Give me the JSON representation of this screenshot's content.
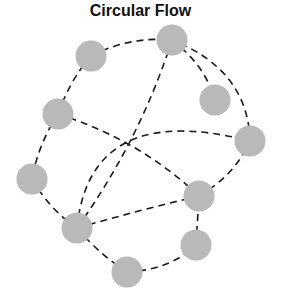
{
  "title": "Circular Flow",
  "colors": {
    "node": "#b9b9b9",
    "edge": "#1a1a1a",
    "background": "#ffffff"
  },
  "nodes": [
    {
      "id": "n1",
      "x": 91,
      "y": 56
    },
    {
      "id": "n2",
      "x": 172,
      "y": 40
    },
    {
      "id": "n3",
      "x": 215,
      "y": 100
    },
    {
      "id": "n4",
      "x": 58,
      "y": 114
    },
    {
      "id": "n5",
      "x": 250,
      "y": 141
    },
    {
      "id": "n6",
      "x": 32,
      "y": 179
    },
    {
      "id": "n7",
      "x": 199,
      "y": 196
    },
    {
      "id": "n8",
      "x": 77,
      "y": 228
    },
    {
      "id": "n9",
      "x": 196,
      "y": 245
    },
    {
      "id": "n10",
      "x": 127,
      "y": 272
    }
  ],
  "edges": [
    {
      "from": "n1",
      "to": "n2",
      "d": "M91,56 Q130,36 172,40"
    },
    {
      "from": "n1",
      "to": "n4",
      "d": "M91,56 Q70,80 58,114"
    },
    {
      "from": "n4",
      "to": "n6",
      "d": "M58,114 Q38,145 32,179"
    },
    {
      "from": "n6",
      "to": "n8",
      "d": "M32,179 Q50,210 77,228"
    },
    {
      "from": "n8",
      "to": "n10",
      "d": "M77,228 Q100,255 127,272"
    },
    {
      "from": "n10",
      "to": "n9",
      "d": "M127,272 Q170,270 196,245"
    },
    {
      "from": "n9",
      "to": "n7",
      "d": "M196,245 L199,196"
    },
    {
      "from": "n7",
      "to": "n5",
      "d": "M199,196 Q235,175 250,141"
    },
    {
      "from": "n5",
      "to": "n2",
      "d": "M250,141 Q248,70 172,40"
    },
    {
      "from": "n2",
      "to": "n3",
      "d": "M172,40 Q205,65 215,100"
    },
    {
      "from": "n2",
      "to": "n8",
      "d": "M172,40 Q140,140 77,228"
    },
    {
      "from": "n4",
      "to": "n7",
      "d": "M58,114 Q140,140 199,196"
    },
    {
      "from": "n8",
      "to": "n7",
      "d": "M77,228 Q140,210 199,196"
    },
    {
      "from": "n8",
      "to": "n5",
      "d": "M77,228 Q90,100 250,141"
    }
  ]
}
